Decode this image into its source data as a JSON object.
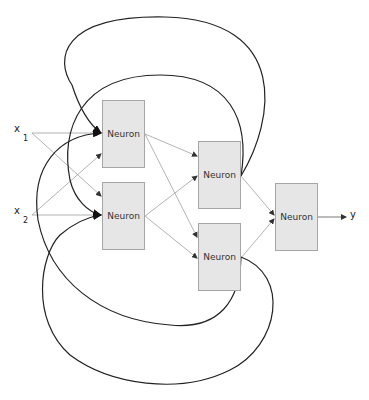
{
  "diagram": {
    "type": "recurrent-neural-network",
    "inputs": [
      {
        "label": "x",
        "subscript": "1"
      },
      {
        "label": "x",
        "subscript": "2"
      }
    ],
    "output": {
      "label": "y"
    },
    "neurons": [
      {
        "id": "n1",
        "label": "Neuron",
        "layer": "hidden-1"
      },
      {
        "id": "n2",
        "label": "Neuron",
        "layer": "hidden-1"
      },
      {
        "id": "n3",
        "label": "Neuron",
        "layer": "hidden-2"
      },
      {
        "id": "n4",
        "label": "Neuron",
        "layer": "hidden-2"
      },
      {
        "id": "n5",
        "label": "Neuron",
        "layer": "output"
      }
    ],
    "edges": [
      {
        "from": "x1",
        "to": "n1",
        "kind": "feedforward"
      },
      {
        "from": "x1",
        "to": "n2",
        "kind": "feedforward"
      },
      {
        "from": "x2",
        "to": "n1",
        "kind": "feedforward"
      },
      {
        "from": "x2",
        "to": "n2",
        "kind": "feedforward"
      },
      {
        "from": "n1",
        "to": "n3",
        "kind": "feedforward"
      },
      {
        "from": "n1",
        "to": "n4",
        "kind": "feedforward"
      },
      {
        "from": "n2",
        "to": "n3",
        "kind": "feedforward"
      },
      {
        "from": "n2",
        "to": "n4",
        "kind": "feedforward"
      },
      {
        "from": "n3",
        "to": "n5",
        "kind": "feedforward"
      },
      {
        "from": "n4",
        "to": "n5",
        "kind": "feedforward"
      },
      {
        "from": "n5",
        "to": "y",
        "kind": "output"
      },
      {
        "from": "n3",
        "to": "n1",
        "kind": "recurrent"
      },
      {
        "from": "n3",
        "to": "n2",
        "kind": "recurrent"
      },
      {
        "from": "n4",
        "to": "n1",
        "kind": "recurrent"
      },
      {
        "from": "n4",
        "to": "n2",
        "kind": "recurrent"
      }
    ],
    "colors": {
      "neuron_fill": "#e6e6e6",
      "neuron_border": "#a6a6a6",
      "feedforward_line": "#a0a0a0",
      "recurrent_line": "#222222"
    }
  }
}
